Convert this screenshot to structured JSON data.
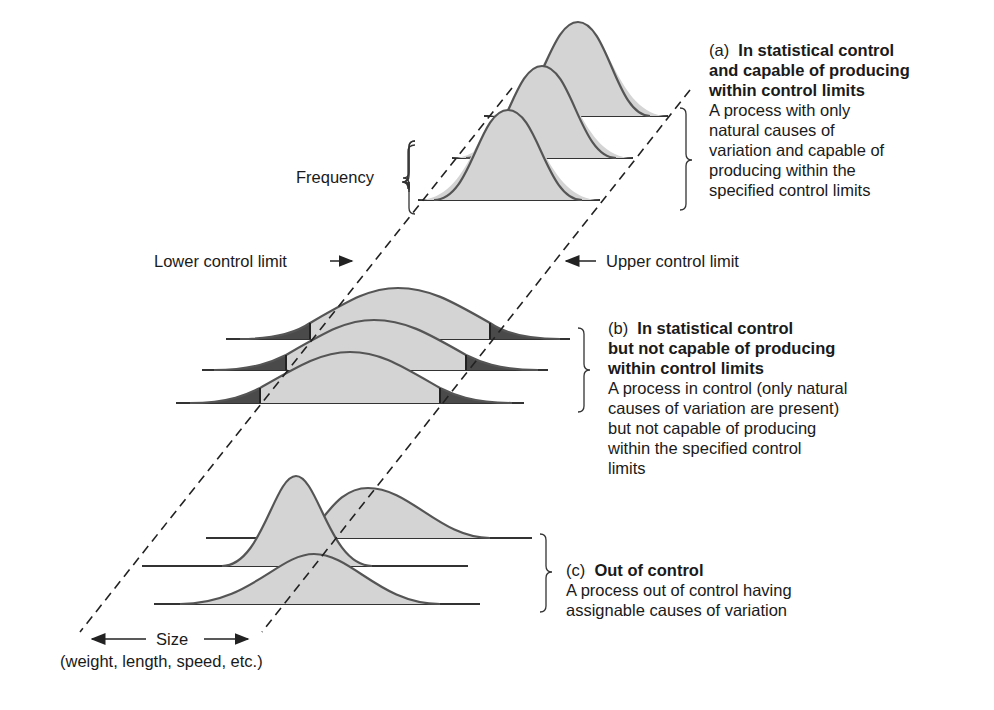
{
  "labels": {
    "frequency": "Frequency",
    "lower_control_limit": "Lower control limit",
    "upper_control_limit": "Upper control limit",
    "size": "Size",
    "size_examples": "(weight, length, speed, etc.)"
  },
  "panels": [
    {
      "id": "a",
      "prefix": "(a)",
      "title_lines": [
        "In statistical control",
        "and capable of producing",
        "within control limits"
      ],
      "description_lines": [
        "A process with only",
        "natural causes of",
        "variation and capable of",
        "producing within the",
        "specified control limits"
      ]
    },
    {
      "id": "b",
      "prefix": "(b)",
      "title_lines": [
        "In statistical control",
        "but not capable of producing",
        "within control limits"
      ],
      "description_lines": [
        "A process in control (only natural",
        "causes of variation are present)",
        "but not capable of producing",
        "within the specified control",
        "limits"
      ]
    },
    {
      "id": "c",
      "prefix": "(c)",
      "title_lines": [
        "Out of control"
      ],
      "description_lines": [
        "A process out of control having",
        "assignable causes of variation"
      ]
    }
  ],
  "colors": {
    "curve_fill": "#d4d4d4",
    "curve_stroke": "#555555",
    "tail_fill": "#4a4a4a",
    "line": "#333333"
  }
}
